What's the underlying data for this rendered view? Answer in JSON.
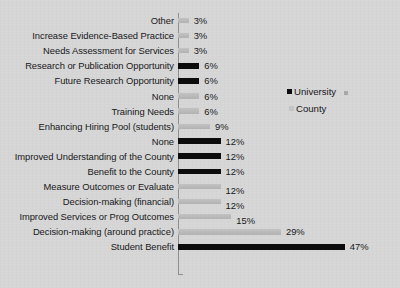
{
  "chart_data": {
    "type": "bar",
    "orientation": "horizontal",
    "title": "",
    "xlabel": "",
    "ylabel": "",
    "xlim": [
      0,
      50
    ],
    "grid": false,
    "legend_position": "right",
    "value_label_suffix": "%",
    "series": [
      {
        "name": "University",
        "color": "#0c0c0c"
      },
      {
        "name": "County",
        "color": "#c4c4c4"
      }
    ],
    "categories": [
      "Other",
      "Increase Evidence-Based Practice",
      "Needs Assessment for Services",
      "Research or Publication Opportunity",
      "Future Research Opportunity",
      "None",
      "Training Needs",
      "Enhancing Hiring Pool (students)",
      "None",
      "Improved Understanding of the County",
      "Benefit to the County",
      "Measure Outcomes or Evaluate",
      "Decision-making (financial)",
      "Improved Services or Prog Outcomes",
      "Decision-making (around practice)",
      "Student Benefit"
    ],
    "values": [
      3,
      3,
      3,
      6,
      6,
      6,
      6,
      9,
      12,
      12,
      12,
      12,
      12,
      15,
      29,
      47
    ],
    "value_labels": [
      "3%",
      "3%",
      "3%",
      "6%",
      "6%",
      "6%",
      "6%",
      "9%",
      "12%",
      "12%",
      "12%",
      "12%",
      "12%",
      "15%",
      "29%",
      "47%"
    ],
    "point_series": [
      "County",
      "County",
      "County",
      "University",
      "University",
      "County",
      "County",
      "County",
      "University",
      "University",
      "University",
      "County",
      "County",
      "County",
      "County",
      "University"
    ]
  },
  "legend": {
    "items": [
      {
        "label": "University",
        "color": "#0c0c0c"
      },
      {
        "label": "County",
        "color": "#c4c4c4"
      }
    ]
  }
}
